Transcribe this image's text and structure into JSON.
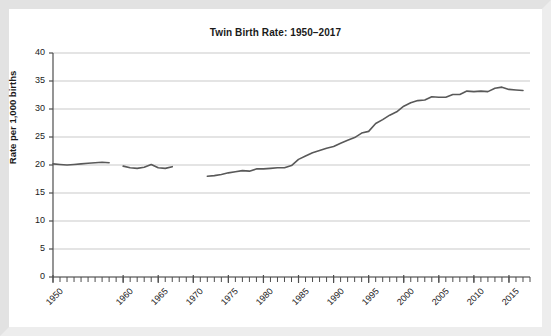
{
  "chart_data": {
    "type": "line",
    "title": "Twin Birth Rate: 1950–2017",
    "xlabel": "",
    "ylabel": "Rate per 1,000 births",
    "ylim": [
      0,
      40
    ],
    "xlim": [
      1950,
      2018
    ],
    "ytick_labels": [
      "40",
      "35",
      "30",
      "25",
      "20",
      "15",
      "10",
      "5",
      "0"
    ],
    "ytick_values": [
      40,
      35,
      30,
      25,
      20,
      15,
      10,
      5,
      0
    ],
    "xtick_labels": [
      "1950",
      "1960",
      "1965",
      "1970",
      "1975",
      "1980",
      "1985",
      "1990",
      "1995",
      "2000",
      "2005",
      "2010",
      "2015"
    ],
    "xtick_values": [
      1950,
      1960,
      1965,
      1970,
      1975,
      1980,
      1985,
      1990,
      1995,
      2000,
      2005,
      2010,
      2015
    ],
    "minor_tick_interval": 1,
    "grid": "horizontal",
    "legend": "none",
    "line_color": "#595959",
    "grid_color": "#c9c9c9",
    "axis_color": "#4d4d4d",
    "background_color": "#ffffff",
    "frame_color": "#e8e8e8",
    "series": [
      {
        "name": "Twin birth rate",
        "note": "Series is drawn as three disjoint segments; years 1959 and 1968–1971 are not plotted",
        "segments": [
          {
            "x": [
              1950,
              1951,
              1952,
              1953,
              1954,
              1955,
              1956,
              1957,
              1958
            ],
            "y": [
              20.2,
              20.1,
              20.0,
              20.1,
              20.2,
              20.3,
              20.4,
              20.5,
              20.4
            ]
          },
          {
            "x": [
              1960,
              1961,
              1962,
              1963,
              1964,
              1965,
              1966,
              1967
            ],
            "y": [
              19.8,
              19.5,
              19.4,
              19.6,
              20.1,
              19.5,
              19.4,
              19.7
            ]
          },
          {
            "x": [
              1972,
              1973,
              1974,
              1975,
              1976,
              1977,
              1978,
              1979,
              1980,
              1981,
              1982,
              1983,
              1984,
              1985,
              1986,
              1987,
              1988,
              1989,
              1990,
              1991,
              1992,
              1993,
              1994,
              1995,
              1996,
              1997,
              1998,
              1999,
              2000,
              2001,
              2002,
              2003,
              2004,
              2005,
              2006,
              2007,
              2008,
              2009,
              2010,
              2011,
              2012,
              2013,
              2014,
              2015,
              2016,
              2017
            ],
            "y": [
              18.0,
              18.1,
              18.3,
              18.6,
              18.8,
              19.0,
              18.9,
              19.3,
              19.3,
              19.4,
              19.5,
              19.5,
              19.9,
              21.0,
              21.6,
              22.2,
              22.6,
              23.0,
              23.3,
              23.9,
              24.4,
              24.9,
              25.7,
              26.0,
              27.4,
              28.1,
              28.9,
              29.5,
              30.5,
              31.1,
              31.5,
              31.6,
              32.2,
              32.1,
              32.1,
              32.6,
              32.6,
              33.2,
              33.1,
              33.2,
              33.1,
              33.7,
              33.9,
              33.5,
              33.4,
              33.3
            ]
          }
        ]
      }
    ]
  }
}
